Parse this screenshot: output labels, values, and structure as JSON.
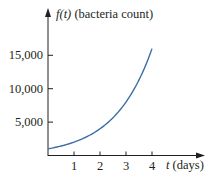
{
  "chart_data": {
    "type": "line",
    "title": "",
    "xlabel": "t (days)",
    "ylabel": "f(t) (bacteria count)",
    "xlabel_var": "t",
    "xlabel_unit": " (days)",
    "ylabel_var": "f(t)",
    "ylabel_unit": " (bacteria count)",
    "x_ticks": [
      "1",
      "2",
      "3",
      "4"
    ],
    "y_ticks": [
      "5,000",
      "10,000",
      "15,000"
    ],
    "xlim": [
      0,
      4.7
    ],
    "ylim": [
      0,
      18000
    ],
    "grid": false,
    "legend": null,
    "series": [
      {
        "name": "f(t)",
        "color": "#3b6ea5",
        "x": [
          0,
          0.5,
          1,
          1.5,
          2,
          2.5,
          3,
          3.5,
          4
        ],
        "values": [
          1000,
          1414,
          2000,
          2828,
          4000,
          5657,
          8000,
          11314,
          16000
        ]
      }
    ]
  },
  "colors": {
    "axis": "#231f20",
    "curve": "#3b6ea5"
  }
}
